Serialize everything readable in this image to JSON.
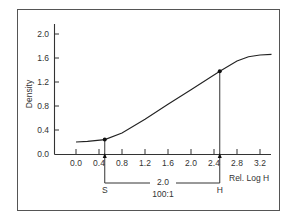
{
  "chart_data": {
    "type": "line",
    "title": "",
    "xlabel": "Rel. Log H",
    "ylabel": "Density",
    "xlim": [
      -0.4,
      3.5
    ],
    "ylim": [
      0.0,
      2.2
    ],
    "x_ticks": [
      "0.0",
      "0.4",
      "0.8",
      "1.2",
      "1.6",
      "2.0",
      "2.4",
      "2.8",
      "3.2"
    ],
    "y_ticks": [
      "0.0",
      "0.4",
      "0.8",
      "1.2",
      "1.6",
      "2.0"
    ],
    "grid": false,
    "series": [
      {
        "name": "Characteristic curve",
        "x": [
          0.0,
          0.2,
          0.5,
          0.8,
          1.2,
          1.6,
          2.0,
          2.5,
          2.8,
          3.0,
          3.2,
          3.4
        ],
        "y": [
          0.2,
          0.21,
          0.24,
          0.35,
          0.58,
          0.83,
          1.07,
          1.38,
          1.55,
          1.62,
          1.65,
          1.66
        ]
      }
    ],
    "markers": [
      {
        "label": "S",
        "x": 0.5,
        "y": 0.24
      },
      {
        "label": "H",
        "x": 2.5,
        "y": 1.38
      }
    ],
    "annotations": {
      "range_value": "2.0",
      "range_ratio": "100:1",
      "left_label": "S",
      "right_label": "H"
    }
  }
}
